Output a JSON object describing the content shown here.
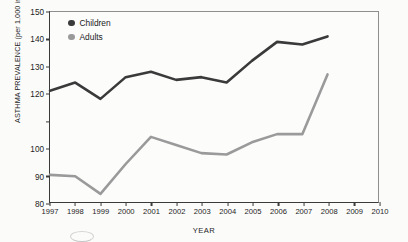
{
  "chart_data": {
    "type": "line",
    "title": "",
    "xlabel": "YEAR",
    "ylabel": "ASTHMA PREVALENCE (per 1,000 individuals)",
    "xlim": [
      1997,
      2010
    ],
    "ylim": [
      80,
      150
    ],
    "grid": false,
    "legend_position": "top-left inside plot",
    "x": [
      1997,
      1998,
      1999,
      2000,
      2001,
      2002,
      2003,
      2004,
      2005,
      2006,
      2007,
      2008
    ],
    "xtick_labels": [
      "1997",
      "1998",
      "1999",
      "2000",
      "2001",
      "2002",
      "2003",
      "2004",
      "2005",
      "2006",
      "2007",
      "2008",
      "2009",
      "2010"
    ],
    "ytick_labels": [
      "150",
      "140",
      "130",
      "120",
      "",
      "100",
      "90",
      "80"
    ],
    "ytick_values": [
      150,
      140,
      130,
      120,
      110,
      100,
      90,
      80
    ],
    "series": [
      {
        "name": "Children",
        "color": "#3a3a3a",
        "values": [
          121,
          124,
          118,
          126,
          128,
          125,
          126,
          124,
          132,
          139,
          138,
          141
        ]
      },
      {
        "name": "Adults",
        "color": "#9a9a9a",
        "values": [
          90,
          89.5,
          83,
          94,
          104,
          101,
          98,
          97.5,
          102,
          105,
          105,
          127
        ]
      }
    ]
  },
  "legend": {
    "items": [
      {
        "label": "Children",
        "color": "#3a3a3a"
      },
      {
        "label": "Adults",
        "color": "#9a9a9a"
      }
    ]
  },
  "axes": {
    "x_title": "YEAR",
    "y_title": "ASTHMA PREVALENCE (per 1,000 individuals)"
  }
}
